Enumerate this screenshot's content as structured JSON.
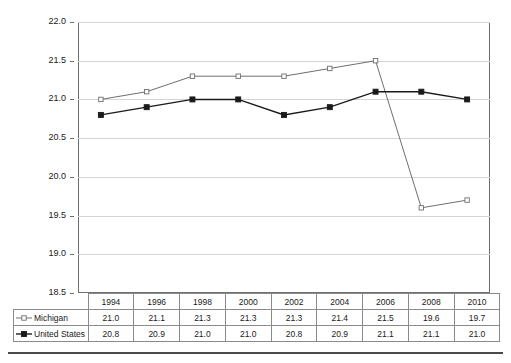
{
  "chart_data": {
    "type": "line",
    "title": "",
    "subtitle": "",
    "xlabel": "",
    "ylabel": "",
    "categories": [
      "1994",
      "1996",
      "1998",
      "2000",
      "2002",
      "2004",
      "2006",
      "2008",
      "2010"
    ],
    "ylim": [
      18.5,
      22.0
    ],
    "ytick_values": [
      18.5,
      19.0,
      19.5,
      20.0,
      20.5,
      21.0,
      21.5,
      22.0
    ],
    "ytick_labels": [
      "18.5",
      "19.0",
      "19.5",
      "20.0",
      "20.5",
      "21.0",
      "21.5",
      "22.0"
    ],
    "grid": true,
    "legend_position": "data-table-left",
    "series": [
      {
        "name": "Michigan",
        "values": [
          21.0,
          21.1,
          21.3,
          21.3,
          21.3,
          21.4,
          21.5,
          19.6,
          19.7
        ],
        "value_labels": [
          "21.0",
          "21.1",
          "21.3",
          "21.3",
          "21.3",
          "21.4",
          "21.5",
          "19.6",
          "19.7"
        ],
        "marker": "open-square",
        "color": "#6e6e6e",
        "marker_fill": "#ffffff"
      },
      {
        "name": "United States",
        "values": [
          20.8,
          20.9,
          21.0,
          21.0,
          20.8,
          20.9,
          21.1,
          21.1,
          21.0
        ],
        "value_labels": [
          "20.8",
          "20.9",
          "21.0",
          "21.0",
          "20.8",
          "20.9",
          "21.1",
          "21.1",
          "21.0"
        ],
        "marker": "filled-square",
        "color": "#1a1a1a",
        "marker_fill": "#1a1a1a"
      }
    ]
  },
  "table": {
    "header_row": [
      "1994",
      "1996",
      "1998",
      "2000",
      "2002",
      "2004",
      "2006",
      "2008",
      "2010"
    ],
    "rows": [
      {
        "label": "Michigan",
        "marker": "open-square-marker",
        "cells": [
          "21.0",
          "21.1",
          "21.3",
          "21.3",
          "21.3",
          "21.4",
          "21.5",
          "19.6",
          "19.7"
        ]
      },
      {
        "label": "United States",
        "marker": "filled-square-marker",
        "cells": [
          "20.8",
          "20.9",
          "21.0",
          "21.0",
          "20.8",
          "20.9",
          "21.1",
          "21.1",
          "21.0"
        ]
      }
    ]
  },
  "axis": {
    "y_labels": [
      "22.0",
      "21.5",
      "21.0",
      "20.5",
      "20.0",
      "19.5",
      "19.0",
      "18.5"
    ]
  },
  "colors": {
    "michigan_line": "#6e6e6e",
    "united_states_line": "#1a1a1a",
    "gridline": "#d4d4d4",
    "frame": "#6e6e6e",
    "table_border": "#8a8a8a",
    "rule": "#4a4a4a"
  }
}
